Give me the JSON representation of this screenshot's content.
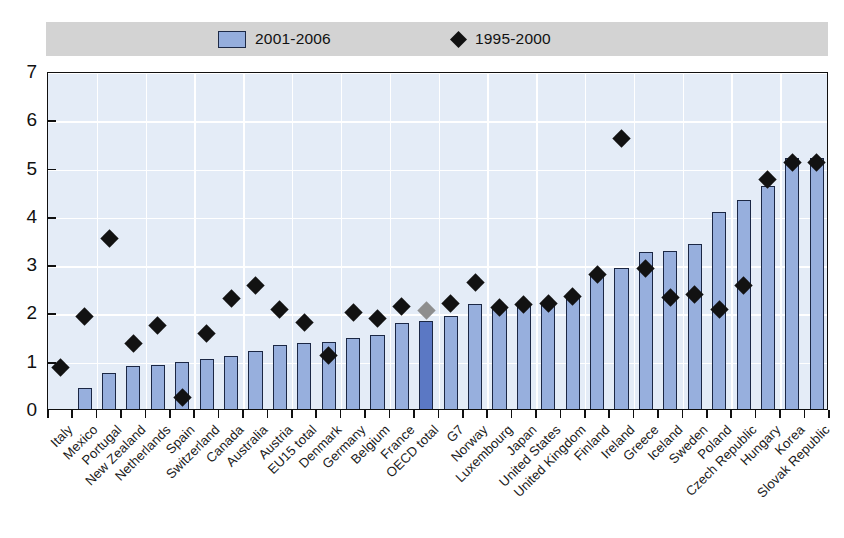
{
  "legend": {
    "bars_label": "2001-2006",
    "diamonds_label": "1995-2000",
    "bar_swatch_icon": "bar-swatch-icon",
    "diamond_swatch_icon": "diamond-swatch-icon",
    "background_color": "#d3d3d3"
  },
  "colors": {
    "bar_fill": "#97afdd",
    "bar_highlight_fill": "#5b78c4",
    "bar_border": "#1b2744",
    "diamond_fill": "#121212",
    "diamond_muted_fill": "#8e8e8e",
    "plot_background": "#e4ecf7",
    "gridline": "#ffffff",
    "axis": "#101010"
  },
  "chart_data": {
    "type": "bar",
    "title": "",
    "subtitle": "",
    "xlabel": "",
    "ylabel": "",
    "ylim": [
      0,
      7
    ],
    "yticks": [
      0,
      1,
      2,
      3,
      4,
      5,
      6,
      7
    ],
    "ytick_labels": [
      "0",
      "1",
      "2",
      "3",
      "4",
      "5",
      "6",
      "7"
    ],
    "grid": true,
    "legend_position": "top",
    "highlight_category": "OECD total",
    "categories": [
      "Italy",
      "Mexico",
      "Portugal",
      "New Zealand",
      "Netherlands",
      "Spain",
      "Switzerland",
      "Canada",
      "Australia",
      "Austria",
      "EU15 total",
      "Denmark",
      "Germany",
      "Belgium",
      "France",
      "OECD total",
      "G7",
      "Norway",
      "Luxembourg",
      "Japan",
      "United States",
      "United Kingdom",
      "Finland",
      "Ireland",
      "Greece",
      "Iceland",
      "Sweden",
      "Poland",
      "Czech Republic",
      "Hungary",
      "Korea",
      "Slovak Republic"
    ],
    "series": [
      {
        "name": "2001-2006",
        "type": "bar",
        "values": [
          0.05,
          0.47,
          0.78,
          0.93,
          0.95,
          1.02,
          1.07,
          1.13,
          1.24,
          1.36,
          1.4,
          1.43,
          1.51,
          1.58,
          1.82,
          1.86,
          1.97,
          2.21,
          2.13,
          2.2,
          2.23,
          2.33,
          2.86,
          2.96,
          3.3,
          3.31,
          3.46,
          4.13,
          4.38,
          4.67,
          5.25,
          5.25
        ]
      },
      {
        "name": "1995-2000",
        "type": "scatter",
        "marker": "diamond",
        "values": [
          0.9,
          1.95,
          3.57,
          1.4,
          1.77,
          0.27,
          1.6,
          2.34,
          2.6,
          2.11,
          1.83,
          1.15,
          2.04,
          1.91,
          2.17,
          2.08,
          2.23,
          2.67,
          2.14,
          2.21,
          2.22,
          2.37,
          2.82,
          5.64,
          2.96,
          2.35,
          2.42,
          2.11,
          2.6,
          4.8,
          5.15,
          5.15
        ]
      }
    ]
  }
}
